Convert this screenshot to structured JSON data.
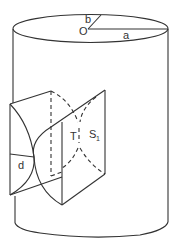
{
  "diagram": {
    "stroke_color": "#333333",
    "background": "#ffffff",
    "labels": {
      "center": "O",
      "radius_a": "a",
      "radius_b": "b",
      "depth": "d",
      "T": "T",
      "S": "S",
      "S_sub": "1"
    }
  }
}
